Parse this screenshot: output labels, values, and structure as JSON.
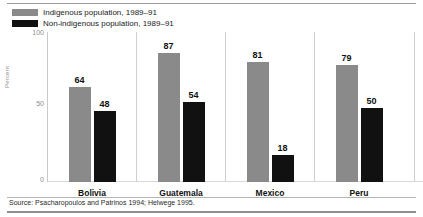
{
  "chart_data": {
    "type": "bar",
    "title": "",
    "subtitle": "",
    "xlabel": "",
    "ylabel": "Percent",
    "ylim": [
      0,
      100
    ],
    "yticks": [
      "0",
      "50",
      "100"
    ],
    "grid": false,
    "legend_position": "top-left",
    "categories": [
      "Bolivia",
      "Guatemala",
      "Mexico",
      "Peru"
    ],
    "series": [
      {
        "name": "Indigenous population, 1989–91",
        "color": "#8a8a8a",
        "values": [
          64,
          87,
          81,
          79
        ]
      },
      {
        "name": "Non-indigenous population, 1989–91",
        "color": "#111111",
        "values": [
          48,
          54,
          18,
          50
        ]
      }
    ],
    "source_note": "Source: Psacharopoulos and Patrinos 1994; Helwege 1995."
  },
  "legend": {
    "items": [
      {
        "label": "Indigenous population, 1989–91",
        "swatch": "indigenous-swatch"
      },
      {
        "label": "Non-indigenous population, 1989–91",
        "swatch": "nonindigenous-swatch"
      }
    ]
  },
  "axis": {
    "y_label": "Percent",
    "tick_top": "100",
    "tick_mid": "50",
    "tick_bottom": "0"
  },
  "footer": {
    "source": "Source: Psacharopoulos and Patrinos 1994; Helwege 1995."
  }
}
